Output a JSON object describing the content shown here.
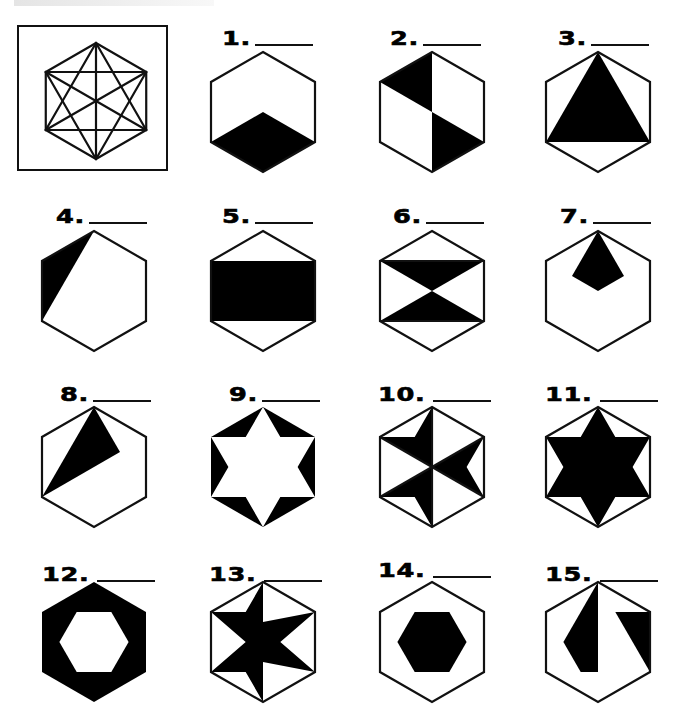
{
  "worksheet": {
    "header_strip": "faint cropped header text (illegible)",
    "reference": {
      "label": "reference-hexagon-with-all-diagonals",
      "box": {
        "x": 17,
        "y": 25,
        "w": 151,
        "h": 146
      },
      "hex_center": [
        94,
        99
      ],
      "hex_radius": 58
    },
    "hex_geometry": {
      "radius": 60,
      "half_width": 52,
      "vertices": "0,-60 52,-30 52,30 0,60 -52,30 -52,-30",
      "stroke": "#111111",
      "fill_dark": "#000000",
      "stroke_width": 2.2
    },
    "blank_line_width": 58,
    "items": [
      {
        "number": "1.",
        "cx": 263,
        "cy": 112,
        "label_x": 222,
        "label_y": 24,
        "blank_w": 58,
        "outline": true,
        "shapes": [
          {
            "type": "polygon",
            "fill": "#000",
            "points": "0,0 52,30 0,60 -52,30"
          }
        ],
        "description": "bottom rhombus of cube shaded"
      },
      {
        "number": "2.",
        "cx": 432,
        "cy": 112,
        "label_x": 390,
        "label_y": 24,
        "blank_w": 58,
        "outline": true,
        "shapes": [
          {
            "type": "polygon",
            "fill": "#000",
            "points": "0,-60 -52,-30 0,0"
          },
          {
            "type": "polygon",
            "fill": "#000",
            "points": "0,0 52,30 0,60"
          }
        ],
        "description": "two opposite triangles shaded"
      },
      {
        "number": "3.",
        "cx": 598,
        "cy": 112,
        "label_x": 558,
        "label_y": 24,
        "blank_w": 58,
        "outline": true,
        "shapes": [
          {
            "type": "polygon",
            "fill": "#000",
            "points": "0,-60 52,30 -52,30"
          }
        ],
        "description": "large triangle from top vertex to lower corners"
      },
      {
        "number": "4.",
        "cx": 94,
        "cy": 291,
        "label_x": 56,
        "label_y": 202,
        "blank_w": 58,
        "outline": true,
        "shapes": [
          {
            "type": "polygon",
            "fill": "#000",
            "points": "0,-60 -52,-30 -52,30"
          }
        ],
        "description": "thin triangle along upper-left edge"
      },
      {
        "number": "5.",
        "cx": 263,
        "cy": 291,
        "label_x": 222,
        "label_y": 202,
        "blank_w": 58,
        "outline": true,
        "shapes": [
          {
            "type": "polygon",
            "fill": "#000",
            "points": "-52,-30 52,-30 52,30 -52,30"
          }
        ],
        "description": "central rectangle shaded"
      },
      {
        "number": "6.",
        "cx": 432,
        "cy": 291,
        "label_x": 393,
        "label_y": 202,
        "blank_w": 58,
        "outline": true,
        "shapes": [
          {
            "type": "polygon",
            "fill": "#000",
            "points": "-52,-30 52,-30 0,0"
          },
          {
            "type": "polygon",
            "fill": "#000",
            "points": "0,0 52,30 -52,30"
          }
        ],
        "lines": [
          "-52,-30 52,-30",
          "-52,30 52,30"
        ],
        "description": "hourglass of two triangles"
      },
      {
        "number": "7.",
        "cx": 598,
        "cy": 291,
        "label_x": 560,
        "label_y": 202,
        "blank_w": 58,
        "outline": true,
        "shapes": [
          {
            "type": "polygon",
            "fill": "#000",
            "points": "0,-60 26,-15 0,0 -26,-15"
          }
        ],
        "description": "small kite hanging from top vertex"
      },
      {
        "number": "8.",
        "cx": 94,
        "cy": 467,
        "label_x": 60,
        "label_y": 380,
        "blank_w": 58,
        "outline": true,
        "shapes": [
          {
            "type": "polygon",
            "fill": "#000",
            "points": "0,-60 26,-15 -52,30"
          }
        ],
        "description": "triangle from top vertex to lower-left vertex and center-right"
      },
      {
        "number": "9.",
        "cx": 263,
        "cy": 467,
        "label_x": 229,
        "label_y": 380,
        "blank_w": 58,
        "outline": false,
        "shapes": [
          {
            "type": "polygon",
            "fill": "#000",
            "points": "0,-60 52,-30 52,30 0,60 -52,30 -52,-30"
          },
          {
            "type": "polygon",
            "fill": "#fff",
            "points": "0,-60 17.3,-30 52,-30 34.6,0 52,30 17.3,30 0,60 -17.3,30 -52,30 -34.6,0 -52,-30 -17.3,-30"
          }
        ],
        "description": "white six-point star, corner triangles shaded"
      },
      {
        "number": "10.",
        "cx": 432,
        "cy": 467,
        "label_x": 378,
        "label_y": 380,
        "blank_w": 58,
        "outline": true,
        "shapes": [
          {
            "type": "polygon",
            "fill": "#000",
            "points": "0,-60 -17.3,-30 -52,-30 0,0"
          },
          {
            "type": "polygon",
            "fill": "#000",
            "points": "52,-30 34.6,0 52,30 0,0"
          },
          {
            "type": "polygon",
            "fill": "#000",
            "points": "-52,30 -17.3,30 0,60 0,0"
          }
        ],
        "lines": [
          "0,-60 0,60",
          "-52,-30 52,30",
          "52,-30 -52,30"
        ],
        "description": "three alternating star points shaded"
      },
      {
        "number": "11.",
        "cx": 598,
        "cy": 467,
        "label_x": 545,
        "label_y": 380,
        "blank_w": 58,
        "outline": true,
        "shapes": [
          {
            "type": "polygon",
            "fill": "#000",
            "points": "0,-60 17.3,-30 52,-30 34.6,0 52,30 17.3,30 0,60 -17.3,30 -52,30 -34.6,0 -52,-30 -17.3,-30"
          }
        ],
        "description": "six-point star shaded"
      },
      {
        "number": "12.",
        "cx": 94,
        "cy": 642,
        "label_x": 42,
        "label_y": 560,
        "blank_w": 58,
        "outline": false,
        "shapes": [
          {
            "type": "polygon",
            "fill": "#000",
            "points": "0,-60 52,-30 52,30 0,60 -52,30 -52,-30"
          },
          {
            "type": "polygon",
            "fill": "#fff",
            "points": "-34.6,0 -17.3,-30 17.3,-30 34.6,0 17.3,30 -17.3,30"
          }
        ],
        "description": "outer hexagon ring shaded, inner hexagon white"
      },
      {
        "number": "13.",
        "cx": 263,
        "cy": 642,
        "label_x": 209,
        "label_y": 560,
        "blank_w": 58,
        "outline": true,
        "shapes": [
          {
            "type": "polygon",
            "fill": "#000",
            "points": "0,-60 0,-20 52,-30 17.3,0 52,30 0,20 0,60 -17.3,30 -52,30 -17.3,0 -52,-30 -17.3,-30"
          }
        ],
        "description": "pinwheel star shaded"
      },
      {
        "number": "14.",
        "cx": 432,
        "cy": 642,
        "label_x": 378,
        "label_y": 556,
        "blank_w": 58,
        "outline": true,
        "shapes": [
          {
            "type": "polygon",
            "fill": "#000",
            "points": "-34.6,0 -17.3,-30 17.3,-30 34.6,0 17.3,30 -17.3,30"
          }
        ],
        "description": "small central hexagon shaded"
      },
      {
        "number": "15.",
        "cx": 598,
        "cy": 642,
        "label_x": 545,
        "label_y": 560,
        "blank_w": 58,
        "outline": true,
        "shapes": [
          {
            "type": "polygon",
            "fill": "#000",
            "points": "0,-60 0,30 -17.3,30 -34.6,0"
          },
          {
            "type": "polygon",
            "fill": "#000",
            "points": "17.3,-30 52,-30 52,30"
          }
        ],
        "description": "two separate shaded pieces"
      }
    ]
  }
}
